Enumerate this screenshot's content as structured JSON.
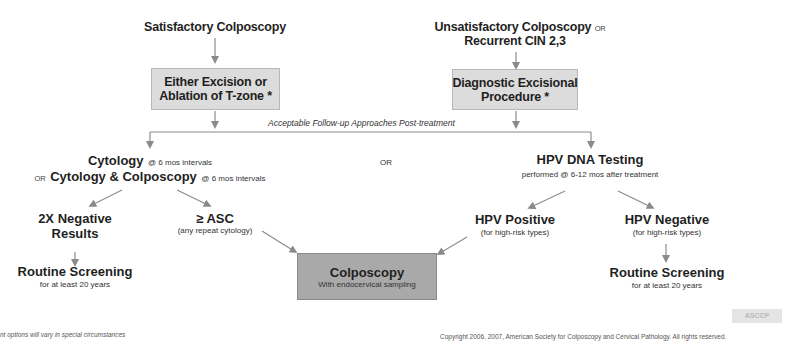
{
  "top_left": {
    "heading": "Satisfactory Colposcopy",
    "box_line1": "Either Excision or",
    "box_line2": "Ablation of T-zone *"
  },
  "top_right": {
    "heading_line1": "Unsatisfactory Colposcopy",
    "heading_or": "OR",
    "heading_line2": "Recurrent CIN 2,3",
    "box_line1": "Diagnostic Excisional",
    "box_line2": "Procedure *"
  },
  "bracket_label": "Acceptable Follow-up Approaches Post-treatment",
  "left_branch": {
    "line1_title": "Cytology",
    "line1_note": "@ 6 mos intervals",
    "line2_or": "OR",
    "line2_title": "Cytology & Colposcopy",
    "line2_note": "@ 6 mos intervals"
  },
  "middle_or": "OR",
  "right_branch": {
    "title": "HPV DNA Testing",
    "note": "performed @ 6-12 mos after treatment"
  },
  "outcomes": {
    "negative2x": {
      "line1": "2X Negative",
      "line2": "Results"
    },
    "asc": {
      "title": "≥ ASC",
      "note": "(any repeat cytology)"
    },
    "hpv_positive": {
      "title": "HPV Positive",
      "note": "(for high-risk types)"
    },
    "hpv_negative": {
      "title": "HPV Negative",
      "note": "(for high-risk types)"
    }
  },
  "routine_left": {
    "title": "Routine Screening",
    "note": "for at least 20 years"
  },
  "routine_right": {
    "title": "Routine Screening",
    "note": "for at least 20 years"
  },
  "colposcopy_box": {
    "title": "Colposcopy",
    "note": "With endocervical sampling"
  },
  "footnote": "nt options will vary in special circumstances",
  "copyright": "Copyright 2006, 2007, American Society for Colposcopy and Cervical Pathology. All rights reserved.",
  "logo_text": "ASCCP",
  "colors": {
    "box_light": "#dcdcdc",
    "box_dark": "#a9a9a9",
    "arrow": "#8a8a8a",
    "text": "#1f1f1f"
  }
}
